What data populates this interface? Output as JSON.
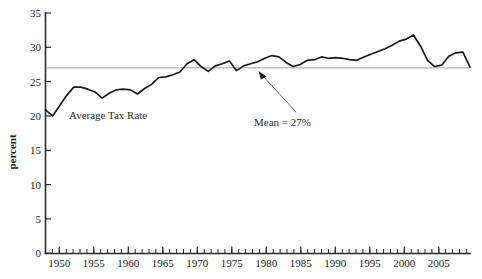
{
  "chart_data": {
    "type": "line",
    "title": "",
    "xlabel": "",
    "ylabel": "percent",
    "xlim": [
      1948,
      2008
    ],
    "ylim": [
      0,
      35
    ],
    "ytick_labels": [
      "0",
      "5",
      "10",
      "15",
      "20",
      "25",
      "30",
      "35"
    ],
    "yticks": [
      0,
      5,
      10,
      15,
      20,
      25,
      30,
      35
    ],
    "xtick_labels": [
      "1950",
      "1955",
      "1960",
      "1965",
      "1970",
      "1975",
      "1980",
      "1985",
      "1990",
      "1995",
      "2000",
      "2005"
    ],
    "xticks": [
      1950,
      1955,
      1960,
      1965,
      1970,
      1975,
      1980,
      1985,
      1990,
      1995,
      2000,
      2005
    ],
    "minor_tick_interval": 1,
    "grid": false,
    "legend": "none",
    "series": [
      {
        "name": "Average Tax Rate",
        "color": "#1b1b1b",
        "x": [
          1948,
          1949,
          1950,
          1951,
          1952,
          1953,
          1954,
          1955,
          1956,
          1957,
          1958,
          1959,
          1960,
          1961,
          1962,
          1963,
          1964,
          1965,
          1966,
          1967,
          1968,
          1969,
          1970,
          1971,
          1972,
          1973,
          1974,
          1975,
          1976,
          1977,
          1978,
          1979,
          1980,
          1981,
          1982,
          1983,
          1984,
          1985,
          1986,
          1987,
          1988,
          1989,
          1990,
          1991,
          1992,
          1993,
          1994,
          1995,
          1996,
          1997,
          1998,
          1999,
          2000,
          2001,
          2002,
          2003,
          2004,
          2005,
          2006,
          2007,
          2008
        ],
        "y": [
          20.9,
          20.0,
          21.5,
          23.0,
          24.2,
          24.2,
          23.9,
          23.5,
          22.6,
          23.3,
          23.8,
          23.9,
          23.8,
          23.2,
          24.0,
          24.6,
          25.6,
          25.7,
          26.0,
          26.4,
          27.6,
          28.2,
          27.2,
          26.5,
          27.3,
          27.6,
          28.0,
          26.6,
          27.3,
          27.6,
          27.9,
          28.4,
          28.8,
          28.6,
          27.8,
          27.2,
          27.5,
          28.1,
          28.2,
          28.6,
          28.4,
          28.5,
          28.4,
          28.2,
          28.1,
          28.6,
          29.0,
          29.4,
          29.8,
          30.3,
          30.9,
          31.2,
          31.8,
          30.2,
          28.1,
          27.2,
          27.4,
          28.7,
          29.2,
          29.3,
          27.1
        ]
      }
    ],
    "reference_lines": [
      {
        "name": "mean",
        "value": 27.0,
        "label": "Mean = 27%",
        "color": "#b4b4b4"
      }
    ],
    "annotations": [
      {
        "name": "series-label",
        "text": "Average Tax Rate",
        "x_px": 69,
        "y_px": 119
      },
      {
        "name": "mean-callout",
        "text": "Mean = 27%",
        "x_px": 254,
        "y_px": 123,
        "arrow_tip_x_px": 259,
        "arrow_tip_y_px": 72,
        "arrow_tail_x_px": 296,
        "arrow_tail_y_px": 112
      }
    ]
  }
}
